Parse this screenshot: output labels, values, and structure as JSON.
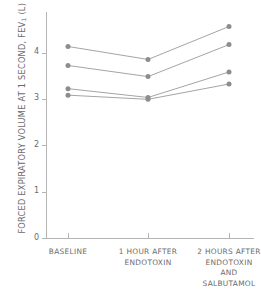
{
  "chart_data": {
    "type": "line",
    "title": "",
    "subtitle": "",
    "xlabel": "",
    "ylabel": "FORCED EXPIRATORY VOLUME AT 1 SECOND, FEV1 (L)",
    "ylabel_main": "FORCED EXPIRATORY VOLUME AT 1 SECOND, FEV",
    "ylabel_sub": "1",
    "ylabel_unit": " (L)",
    "categories": [
      "BASELINE",
      "1 HOUR AFTER ENDOTOXIN",
      "2 HOURS AFTER ENDOTOXIN AND SALBUTAMOL"
    ],
    "category_lines": [
      [
        "BASELINE"
      ],
      [
        "1 HOUR AFTER",
        "ENDOTOXIN"
      ],
      [
        "2 HOURS AFTER",
        "ENDOTOXIN",
        "AND",
        "SALBUTAMOL"
      ]
    ],
    "ylim": [
      0,
      4.5
    ],
    "yticks": [
      0,
      1,
      2,
      3,
      4
    ],
    "ytick_labels": [
      "0",
      "1",
      "2",
      "3",
      "4"
    ],
    "grid": false,
    "legend": "none",
    "marker": "circle",
    "series": [
      {
        "name": "Subject 1",
        "values": [
          4.13,
          3.85,
          4.56
        ]
      },
      {
        "name": "Subject 2",
        "values": [
          3.72,
          3.48,
          4.17
        ]
      },
      {
        "name": "Subject 3",
        "values": [
          3.22,
          3.03,
          3.58
        ]
      },
      {
        "name": "Subject 4",
        "values": [
          3.08,
          2.99,
          3.32
        ]
      }
    ],
    "colors": {
      "line": "#9a9a9a",
      "marker": "#8d8d8d",
      "axis": "#b4b4b4",
      "text": "#6b6b6b",
      "background": "#ffffff"
    }
  }
}
